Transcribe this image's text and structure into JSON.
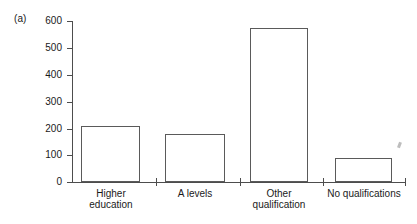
{
  "figure": {
    "panel_label": "(a)",
    "background_color": "#ffffff",
    "axis_color": "#4d4d4d",
    "bar_outline_color": "#5a5a5a",
    "bar_fill_color": "#ffffff"
  },
  "chart_data": {
    "type": "bar",
    "title": "",
    "subtitle": "",
    "xlabel": "",
    "ylabel": "",
    "categories": [
      "Higher\neducation",
      "A levels",
      "Other\nqualification",
      "No qualifications"
    ],
    "values": [
      208,
      180,
      573,
      88
    ],
    "ylim": [
      0,
      600
    ],
    "yticks": [
      0,
      100,
      200,
      300,
      400,
      500,
      600
    ],
    "ytick_labels": [
      "0",
      "100",
      "200",
      "300",
      "400",
      "500",
      "600"
    ],
    "grid": false,
    "legend": null,
    "legend_position": "none",
    "annotations": [
      "(a)"
    ]
  }
}
